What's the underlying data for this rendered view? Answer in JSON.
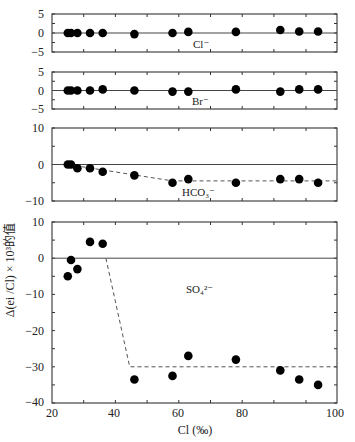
{
  "chart_data": [
    {
      "type": "scatter",
      "panel": "Cl",
      "label": "Cl⁻",
      "ylim": [
        -5,
        5
      ],
      "yticks": [
        5,
        0,
        -5
      ],
      "x": [
        25,
        26,
        28,
        32,
        36,
        46,
        58,
        63,
        78,
        91,
        94,
        97
      ],
      "values": [
        0,
        0,
        0,
        0,
        0,
        -0.3,
        0,
        0.3,
        0.3,
        0.8,
        0.4,
        0.4
      ],
      "reference_line": 0
    },
    {
      "type": "scatter",
      "panel": "Br",
      "label": "Br⁻",
      "ylim": [
        -5,
        5
      ],
      "yticks": [
        5,
        0,
        -5
      ],
      "x": [
        25,
        26,
        28,
        32,
        36,
        46,
        58,
        63,
        78,
        91,
        94,
        97
      ],
      "values": [
        0,
        0,
        0,
        0,
        0.3,
        0,
        -0.3,
        -0.3,
        0.3,
        -0.3,
        0.3,
        0.3
      ],
      "reference_line": 0
    },
    {
      "type": "scatter",
      "panel": "HCO3",
      "label": "HCO₃⁻",
      "ylim": [
        -10,
        10
      ],
      "yticks": [
        10,
        0,
        -10
      ],
      "x": [
        25,
        26,
        28,
        32,
        36,
        46,
        58,
        63,
        78,
        91,
        94,
        97
      ],
      "values": [
        0,
        0,
        -1,
        -1,
        -2,
        -3,
        -5,
        -4,
        -5,
        -4,
        -4,
        -5
      ],
      "reference_line": 0,
      "trend_line": {
        "style": "dashed",
        "points": [
          [
            25,
            0
          ],
          [
            58,
            -4.5
          ],
          [
            100,
            -4.5
          ]
        ]
      }
    },
    {
      "type": "scatter",
      "panel": "SO4",
      "label": "SO₄²⁻",
      "ylim": [
        -40,
        10
      ],
      "yticks": [
        10,
        0,
        -10,
        -20,
        -30,
        -40
      ],
      "x": [
        25,
        26,
        28,
        32,
        36,
        46,
        58,
        63,
        78,
        91,
        94,
        97
      ],
      "values": [
        -5,
        -0.5,
        -3,
        4.5,
        4,
        -33.5,
        -32.5,
        -27,
        -28,
        -31,
        -33.5,
        -35
      ],
      "reference_line": 0,
      "trend_line": {
        "style": "dashed",
        "points": [
          [
            37,
            0
          ],
          [
            44.5,
            -30
          ],
          [
            100,
            -30
          ]
        ]
      }
    }
  ],
  "axes": {
    "xlabel": "Cl (‰)",
    "ylabel": "Δ(ei /Cl) × 10³的值",
    "xticks": [
      "20",
      "40",
      "60",
      "80",
      "100"
    ],
    "xlim": [
      20,
      100
    ],
    "grid": false
  },
  "labels": {
    "cl": "Cl⁻",
    "br": "Br⁻",
    "hco3": "HCO₃⁻",
    "so4": "SO₄²⁻",
    "y5": "5",
    "y0": "0",
    "yn5": "−5",
    "y10": "10",
    "yn10": "−10",
    "yn20": "−20",
    "yn30": "−30",
    "yn40": "−40",
    "x20": "20",
    "x40": "40",
    "x60": "60",
    "x80": "80",
    "x100": "100"
  }
}
